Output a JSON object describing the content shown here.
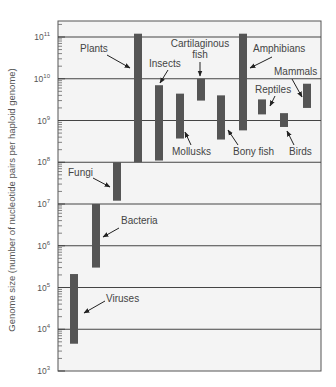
{
  "chart_data": {
    "type": "bar",
    "subtype": "floating-range",
    "title": "",
    "xlabel": "",
    "ylabel": "Genome size (number of nucleotide pairs per haploid genome)",
    "yscale": "log",
    "ylim": [
      1000,
      100000000000
    ],
    "yticks": [
      {
        "exp": "3",
        "value": 1000
      },
      {
        "exp": "4",
        "value": 10000
      },
      {
        "exp": "5",
        "value": 100000
      },
      {
        "exp": "6",
        "value": 1000000
      },
      {
        "exp": "7",
        "value": 10000000
      },
      {
        "exp": "8",
        "value": 100000000
      },
      {
        "exp": "9",
        "value": 1000000000
      },
      {
        "exp": "10",
        "value": 10000000000
      },
      {
        "exp": "11",
        "value": 100000000000
      }
    ],
    "grid": true,
    "legend": "none",
    "series": [
      {
        "name": "Viruses",
        "low": 4500,
        "high": 210000
      },
      {
        "name": "Bacteria",
        "low": 300000,
        "high": 10000000
      },
      {
        "name": "Fungi",
        "low": 12000000,
        "high": 100000000
      },
      {
        "name": "Plants",
        "low": 100000000,
        "high": 120000000000
      },
      {
        "name": "Insects",
        "low": 110000000,
        "high": 7000000000
      },
      {
        "name": "Mollusks",
        "low": 370000000,
        "high": 4400000000
      },
      {
        "name": "Cartilaginous fish",
        "low": 3000000000,
        "high": 10000000000
      },
      {
        "name": "Bony fish",
        "low": 350000000,
        "high": 4000000000
      },
      {
        "name": "Amphibians",
        "low": 580000000,
        "high": 120000000000
      },
      {
        "name": "Reptiles",
        "low": 1400000000,
        "high": 3200000000
      },
      {
        "name": "Birds",
        "low": 700000000,
        "high": 1500000000
      },
      {
        "name": "Mammals",
        "low": 2000000000,
        "high": 7600000000
      }
    ]
  },
  "colors": {
    "bar": "#555555",
    "grid": "#444444",
    "background": "#f4f4f4",
    "text": "#444444"
  },
  "labels": {
    "plants": "Plants",
    "insects": "Insects",
    "cartilaginous_line1": "Cartilaginous",
    "cartilaginous_line2": "fish",
    "amphibians": "Amphibians",
    "mammals": "Mammals",
    "reptiles": "Reptiles",
    "mollusks": "Mollusks",
    "bony_fish": "Bony fish",
    "birds": "Birds",
    "fungi": "Fungi",
    "bacteria": "Bacteria",
    "viruses": "Viruses"
  }
}
